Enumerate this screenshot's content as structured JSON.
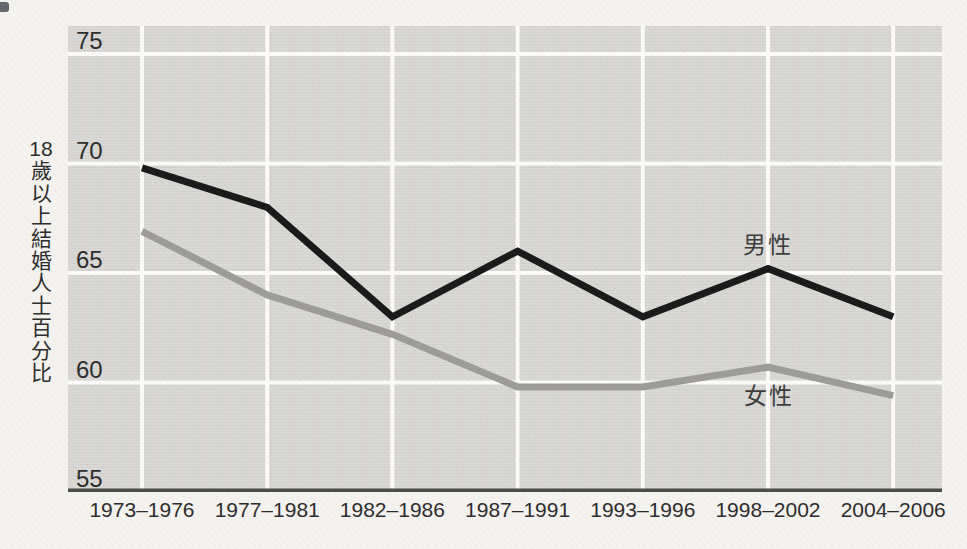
{
  "chart_data": {
    "type": "line",
    "title": "",
    "xlabel": "",
    "ylabel": "18歲以上結婚人士百分比",
    "categories": [
      "1973–1976",
      "1977–1981",
      "1982–1986",
      "1987–1991",
      "1993–1996",
      "1998–2002",
      "2004–2006"
    ],
    "series": [
      {
        "name": "男性",
        "color": "#1a1a1a",
        "values": [
          69.8,
          68.0,
          63.0,
          66.0,
          63.0,
          65.2,
          63.0
        ]
      },
      {
        "name": "女性",
        "color": "#9d9c9a",
        "values": [
          66.9,
          64.0,
          62.2,
          59.8,
          59.8,
          60.7,
          59.4
        ]
      }
    ],
    "y_ticks": [
      75,
      70,
      65,
      60,
      55
    ],
    "ylim": [
      55,
      76.3
    ],
    "grid": true,
    "legend_position": "inline-labels-near-lines",
    "style": {
      "plot_background": "#d9d8d5",
      "page_background": "#f5f3ef",
      "gridline_color": "#fcfbf9",
      "axis_color": "#4d4d4d",
      "tick_text_color": "#2d2d2d",
      "series_label_color": "#3d3d3d"
    }
  }
}
